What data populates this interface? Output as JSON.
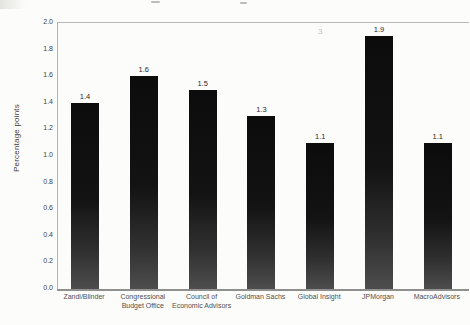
{
  "figure": {
    "background": "#fcfcfa",
    "axis_color": "#b2b2b0",
    "baseline_color": "#8f8f8d",
    "bar_color_top": "#0c0c0c",
    "bar_color_bottom": "#4d4d4d",
    "tick_label_color": "#3f3f3f",
    "category_label_color": "#4f4f4f",
    "value_label_color": "#2a2a2a"
  },
  "chart_data": {
    "type": "bar",
    "title": "",
    "ylabel": "Percentage points",
    "xlabel": "",
    "ylim": [
      0.0,
      2.0
    ],
    "ytick_step": 0.2,
    "yticks": [
      "2.0",
      "1.8",
      "1.6",
      "1.4",
      "1.2",
      "1.0",
      "0.8",
      "0.6",
      "0.4",
      "0.2",
      "0.0"
    ],
    "categories": [
      "Zandi/Blinder",
      "Congressional Budget Office",
      "Council of Economic Advisors",
      "Goldman Sachs",
      "Global Insight",
      "JPMorgan",
      "MacroAdvisors"
    ],
    "values": [
      1.4,
      1.6,
      1.5,
      1.3,
      1.1,
      1.9,
      1.1
    ],
    "value_labels": [
      "1.4",
      "1.6",
      "1.5",
      "1.3",
      "1.1",
      "1.9",
      "1.1"
    ],
    "grid": false,
    "legend": null
  },
  "annotations": {
    "faint_footnote_marker": "3"
  }
}
